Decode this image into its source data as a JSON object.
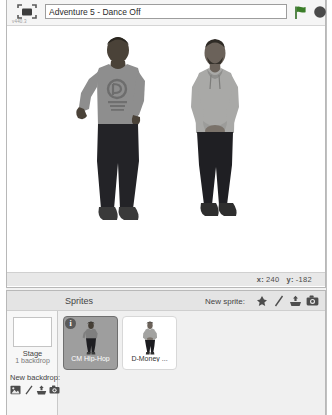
{
  "app": {
    "version_label": "v440.3",
    "logo_icon": "scratch-logo-icon"
  },
  "toolbar": {
    "project_title_value": "Adventure 5 - Dance Off",
    "project_title_placeholder": "Project name",
    "green_flag_icon": "green-flag-icon",
    "stop_icon": "stop-sign-icon"
  },
  "stage": {
    "coords": {
      "x_axis_label": "x:",
      "x_value": "240",
      "y_axis_label": "y:",
      "y_value": "-182"
    },
    "sprites_on_stage": [
      {
        "name": "CM Hip-Hop",
        "description": "person in gray logo t-shirt and dark pants"
      },
      {
        "name": "D-Money",
        "description": "person in light gray hoodie with hands clasped"
      }
    ]
  },
  "sprite_pane": {
    "title": "Sprites",
    "new_sprite_label": "New sprite:",
    "new_sprite_icons": [
      "choose-sprite-from-library-icon",
      "paint-new-sprite-icon",
      "upload-sprite-from-file-icon",
      "new-sprite-from-camera-icon"
    ],
    "stage_selector": {
      "name": "Stage",
      "backdrop_count": "1 backdrop",
      "new_backdrop_label": "New backdrop:",
      "new_backdrop_icons": [
        "choose-backdrop-from-library-icon",
        "paint-new-backdrop-icon",
        "upload-backdrop-from-file-icon",
        "new-backdrop-from-camera-icon"
      ]
    },
    "sprites": [
      {
        "label": "CM Hip-Hop",
        "selected": true,
        "info_badge": "i"
      },
      {
        "label": "D-Money ...",
        "selected": false,
        "info_badge": ""
      }
    ]
  },
  "colors": {
    "panel_bg": "#f0f0f0",
    "stage_bg": "#ffffff",
    "selected_sprite_bg": "#9e9e9e",
    "flag_green": "#3a7d28",
    "stop_dark": "#4a4a4a",
    "border": "#b8b8b8"
  }
}
